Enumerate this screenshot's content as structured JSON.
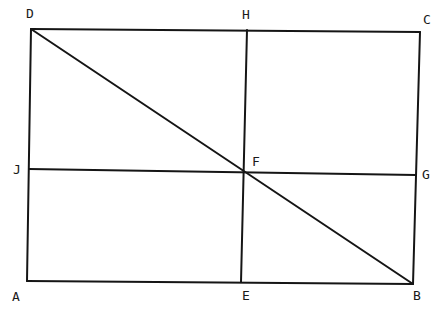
{
  "diagram": {
    "type": "geometry-rectangle",
    "points": {
      "A": {
        "x": 27,
        "y": 281
      },
      "B": {
        "x": 413,
        "y": 284
      },
      "C": {
        "x": 420,
        "y": 32
      },
      "D": {
        "x": 31,
        "y": 29
      },
      "E": {
        "x": 241,
        "y": 282
      },
      "F": {
        "x": 244,
        "y": 172
      },
      "G": {
        "x": 416,
        "y": 175
      },
      "H": {
        "x": 247,
        "y": 30
      },
      "J": {
        "x": 29,
        "y": 169
      }
    },
    "labels": {
      "A": "A",
      "B": "B",
      "C": "C",
      "D": "D",
      "E": "E",
      "F": "F",
      "G": "G",
      "H": "H",
      "J": "J"
    },
    "segments": [
      [
        "A",
        "B"
      ],
      [
        "B",
        "C"
      ],
      [
        "C",
        "D"
      ],
      [
        "D",
        "A"
      ],
      [
        "D",
        "B"
      ],
      [
        "H",
        "E"
      ],
      [
        "J",
        "G"
      ]
    ]
  }
}
